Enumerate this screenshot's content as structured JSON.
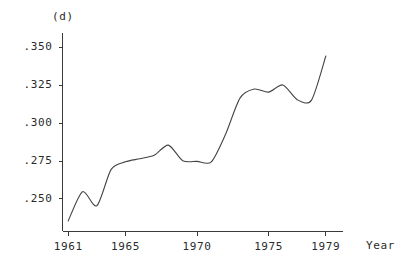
{
  "chart_data": {
    "type": "line",
    "title": "(d)",
    "xlabel": "Year",
    "ylabel": "",
    "xlim": [
      1960.6,
      1980.2
    ],
    "ylim": [
      0.2285,
      0.3595
    ],
    "grid": false,
    "legend": null,
    "x_ticks": [
      1961,
      1965,
      1970,
      1975,
      1979
    ],
    "x_tick_labels": [
      "1961",
      "1965",
      "1970",
      "1975",
      "1979"
    ],
    "y_ticks": [
      0.25,
      0.275,
      0.3,
      0.325,
      0.35
    ],
    "y_tick_labels": [
      ".250",
      ".275",
      ".300",
      ".325",
      ".350"
    ],
    "series": [
      {
        "name": "(d)",
        "x": [
          1961,
          1962,
          1963,
          1964,
          1965,
          1966,
          1967,
          1968,
          1969,
          1970,
          1971,
          1972,
          1973,
          1974,
          1975,
          1976,
          1977,
          1978,
          1979
        ],
        "values": [
          0.2355,
          0.2548,
          0.2455,
          0.2695,
          0.2745,
          0.2765,
          0.2788,
          0.2855,
          0.2752,
          0.2748,
          0.2745,
          0.2928,
          0.3165,
          0.3225,
          0.3205,
          0.3252,
          0.3155,
          0.3152,
          0.3443
        ]
      }
    ],
    "annotations": []
  },
  "axes": {
    "y_axis_name": "value-axis",
    "x_axis_name": "year-axis",
    "x_axis_caption": "Year",
    "plot_caption": "(d)"
  }
}
